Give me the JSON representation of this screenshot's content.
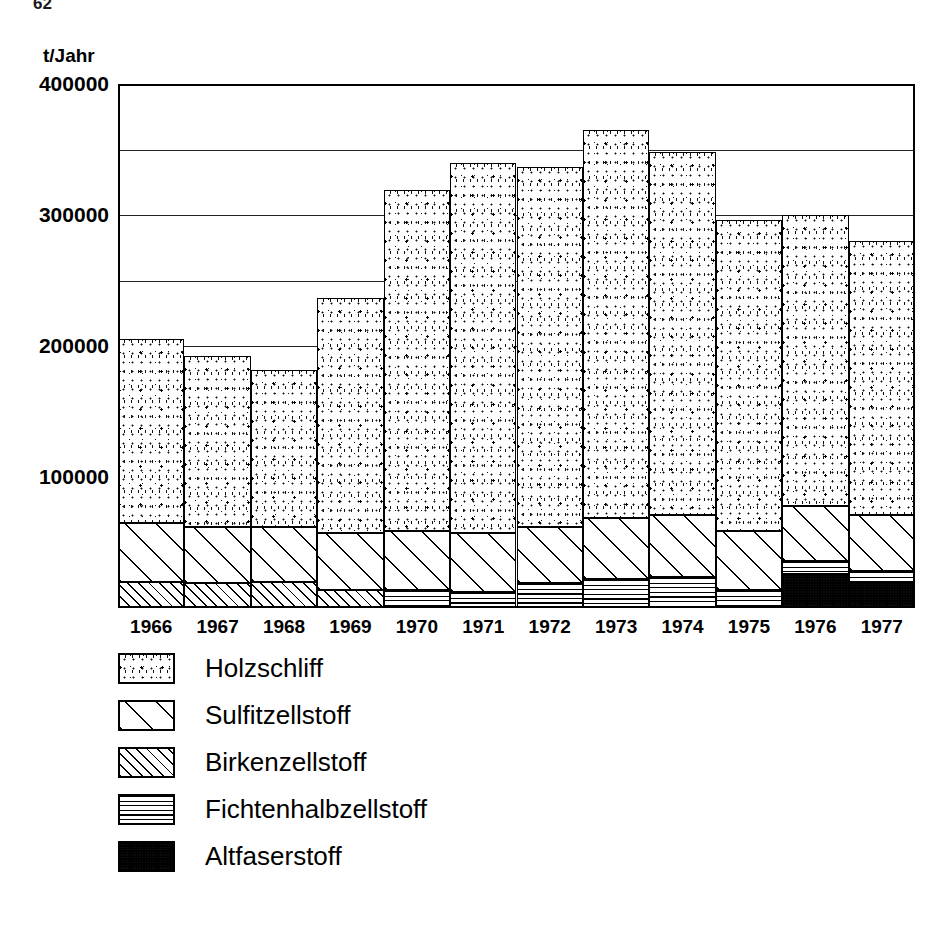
{
  "page_number": "62",
  "chart_data": {
    "type": "bar",
    "subtype": "stacked",
    "title": "",
    "xlabel": "",
    "ylabel": "t/Jahr",
    "ylim": [
      0,
      400000
    ],
    "ytick_values": [
      400000,
      300000,
      200000,
      100000
    ],
    "ytick_labels": [
      "400000",
      "300000",
      "200000",
      "100000"
    ],
    "gridline_values": [
      350000,
      300000,
      250000,
      200000
    ],
    "grid": true,
    "legend_position": "below-left",
    "categories": [
      "1966",
      "1967",
      "1968",
      "1969",
      "1970",
      "1971",
      "1972",
      "1973",
      "1974",
      "1975",
      "1976",
      "1977"
    ],
    "series": [
      {
        "name": "Holzschliff",
        "pattern": "dots",
        "values": [
          140000,
          130000,
          120000,
          180000,
          260000,
          283000,
          275000,
          296000,
          277000,
          237000,
          222000,
          209000
        ]
      },
      {
        "name": "Sulfitzellstoff",
        "pattern": "wide-diagonal",
        "values": [
          45000,
          43000,
          42000,
          43000,
          45000,
          45000,
          43000,
          47000,
          47000,
          45000,
          42000,
          43000
        ]
      },
      {
        "name": "Birkenzellstoff",
        "pattern": "narrow-diagonal",
        "values": [
          20000,
          19000,
          20000,
          14000,
          0,
          0,
          0,
          0,
          0,
          0,
          0,
          0
        ]
      },
      {
        "name": "Fichtenhalbzellstoff",
        "pattern": "horizontal",
        "values": [
          0,
          0,
          0,
          0,
          14000,
          12000,
          19000,
          22000,
          24000,
          14000,
          10000,
          9000
        ]
      },
      {
        "name": "Altfaserstoff",
        "pattern": "dark-stipple",
        "values": [
          0,
          0,
          0,
          0,
          0,
          0,
          0,
          0,
          0,
          0,
          26000,
          19000
        ]
      }
    ],
    "totals": [
      205000,
      192000,
      182000,
      237000,
      319000,
      340000,
      337000,
      365000,
      348000,
      296000,
      300000,
      280000
    ]
  },
  "legend": {
    "items": [
      {
        "label": "Holzschliff"
      },
      {
        "label": "Sulfitzellstoff"
      },
      {
        "label": "Birkenzellstoff"
      },
      {
        "label": "Fichtenhalbzellstoff"
      },
      {
        "label": "Altfaserstoff"
      }
    ]
  }
}
